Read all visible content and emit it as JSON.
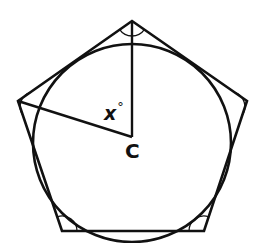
{
  "figure": {
    "type": "geometry",
    "shape": "regular-pentagon",
    "inscribed": "circle",
    "center_label": "C",
    "angle_label": "x",
    "angle_unit": "°",
    "interior_angle_marks": 5
  },
  "labels": {
    "angle": "x",
    "degree": "°",
    "center": "C"
  },
  "colors": {
    "stroke": "#111111",
    "background": "#ffffff"
  }
}
